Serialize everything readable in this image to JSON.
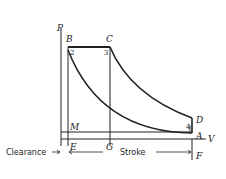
{
  "diagram": {
    "type": "P-V indicator diagram",
    "axes": {
      "y_label": "P",
      "x_label": "V"
    },
    "points": {
      "B": "B",
      "C": "C",
      "D": "D",
      "A": "A",
      "M": "M",
      "E": "E",
      "G": "G",
      "F": "F"
    },
    "state_numbers": {
      "n1": "1",
      "n2": "2",
      "n3": "3",
      "n4": "4"
    },
    "dimensions": {
      "clearance": "Clearance",
      "stroke": "Stroke"
    },
    "colors": {
      "line": "#222222",
      "background": "#ffffff"
    }
  }
}
